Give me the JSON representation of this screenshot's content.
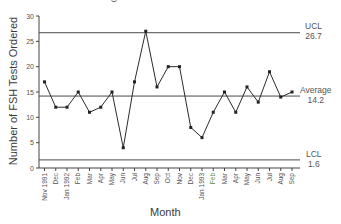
{
  "chart_data": {
    "type": "line",
    "title": "",
    "xlabel": "Month",
    "ylabel": "Number of FSH Tests Ordered",
    "ylim": [
      0,
      30
    ],
    "yticks": [
      0,
      5,
      10,
      15,
      20,
      25,
      30
    ],
    "grid": false,
    "categories": [
      "Nov 1991",
      "Dec",
      "Jan 1992",
      "Feb",
      "Mar",
      "Apr",
      "May",
      "Jun",
      "Jul",
      "Aug",
      "Sep",
      "Oct",
      "Nov",
      "Dec",
      "Jan 1993",
      "Feb",
      "Mar",
      "Apr",
      "May",
      "Jun",
      "Jul",
      "Aug",
      "Sep"
    ],
    "series": [
      {
        "name": "FSH Tests Ordered",
        "values": [
          17,
          12,
          12,
          15,
          11,
          12,
          15,
          4,
          17,
          27,
          16,
          20,
          20,
          8,
          6,
          11,
          15,
          11,
          16,
          13,
          19,
          14,
          15
        ]
      }
    ],
    "control_lines": [
      {
        "name": "UCL",
        "value": 26.7,
        "label": "UCL",
        "value_label": "26.7"
      },
      {
        "name": "Average",
        "value": 14.2,
        "label": "Average",
        "value_label": "14.2"
      },
      {
        "name": "LCL",
        "value": 1.6,
        "label": "LCL",
        "value_label": "1.6"
      }
    ]
  },
  "labels": {
    "ylabel": "Number of FSH Tests Ordered",
    "xlabel": "Month",
    "ucl": "UCL",
    "ucl_value": "26.7",
    "avg": "Average",
    "avg_value": "14.2",
    "lcl": "LCL",
    "lcl_value": "1.6"
  },
  "colors": {
    "line": "#2b2b2b",
    "control_line": "#4a4a4a",
    "text": "#3a3a3a",
    "highlight_tick": "#5a8a4a"
  }
}
